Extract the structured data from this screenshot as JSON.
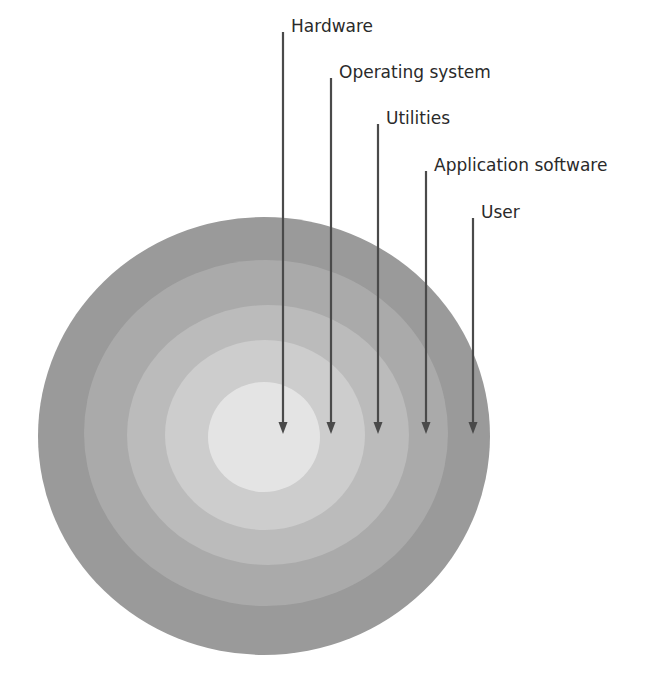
{
  "diagram": {
    "type": "concentric-layers",
    "title": "",
    "rings": [
      {
        "name": "user",
        "label": "User",
        "color": "#9a9a9a",
        "cx": 264,
        "cy": 436,
        "rx": 226,
        "ry": 219
      },
      {
        "name": "application-software",
        "label": "Application software",
        "color": "#aaaaaa",
        "cx": 266,
        "cy": 433,
        "rx": 182,
        "ry": 173
      },
      {
        "name": "utilities",
        "label": "Utilities",
        "color": "#bbbbbb",
        "cx": 268,
        "cy": 435,
        "rx": 141,
        "ry": 130
      },
      {
        "name": "operating-system",
        "label": "Operating system",
        "color": "#cdcdcd",
        "cx": 265,
        "cy": 435,
        "rx": 100,
        "ry": 95
      },
      {
        "name": "hardware",
        "label": "Hardware",
        "color": "#e4e4e4",
        "cx": 264,
        "cy": 437,
        "rx": 56,
        "ry": 55
      }
    ],
    "labels": [
      {
        "text": "Hardware",
        "x": 291,
        "y": 32,
        "line_x": 283,
        "line_top": 32,
        "arrow_tip": 434
      },
      {
        "text": "Operating system",
        "x": 339,
        "y": 78,
        "line_x": 331,
        "line_top": 78,
        "arrow_tip": 434
      },
      {
        "text": "Utilities",
        "x": 386,
        "y": 124,
        "line_x": 378,
        "line_top": 124,
        "arrow_tip": 434
      },
      {
        "text": "Application software",
        "x": 434,
        "y": 171,
        "line_x": 426,
        "line_top": 171,
        "arrow_tip": 434
      },
      {
        "text": "User",
        "x": 481,
        "y": 218,
        "line_x": 473,
        "line_top": 218,
        "arrow_tip": 434
      }
    ],
    "colors": {
      "arrow": "#4a4a4a",
      "text": "#2a2a2a",
      "background": "#ffffff"
    }
  }
}
